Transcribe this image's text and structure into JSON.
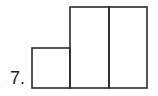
{
  "problem": {
    "number_label": "7."
  },
  "diagram": {
    "stroke_color": "#2a2a2a",
    "stroke_width": 1.6,
    "shapes": [
      {
        "name": "small-square",
        "x": 32,
        "y": 48,
        "w": 38,
        "h": 40
      },
      {
        "name": "tall-rect-left",
        "x": 70,
        "y": 7,
        "w": 39,
        "h": 81
      },
      {
        "name": "tall-rect-right",
        "x": 109,
        "y": 7,
        "w": 38,
        "h": 81
      }
    ]
  }
}
